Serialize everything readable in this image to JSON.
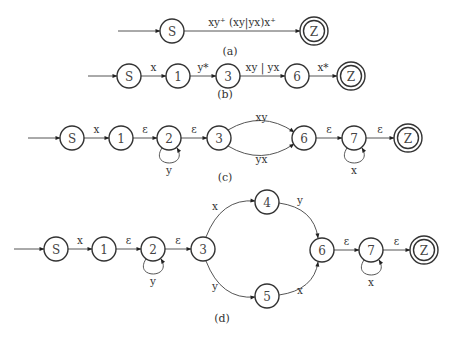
{
  "diagrams": [
    {
      "id": "a",
      "caption": "(a)",
      "caption_pos": [
        230,
        55
      ],
      "start": {
        "from": [
          118,
          31
        ],
        "to": "S"
      },
      "nodes": [
        {
          "id": "S",
          "label": "S",
          "x": 172,
          "y": 31,
          "final": false
        },
        {
          "id": "Z",
          "label": "Z",
          "x": 314,
          "y": 31,
          "final": true
        }
      ],
      "edges": [
        {
          "from": "S",
          "to": "Z",
          "label": "xy⁺ (xy|yx)x⁺",
          "label_text": "xy * (xy|yx)x *",
          "type": "straight"
        }
      ]
    },
    {
      "id": "b",
      "caption": "(b)",
      "caption_pos": [
        225,
        98
      ],
      "start": {
        "from": [
          88,
          76
        ],
        "to": "S"
      },
      "nodes": [
        {
          "id": "S",
          "label": "S",
          "x": 129,
          "y": 76,
          "final": false
        },
        {
          "id": "1",
          "label": "1",
          "x": 178,
          "y": 76,
          "final": false
        },
        {
          "id": "3",
          "label": "3",
          "x": 228,
          "y": 76,
          "final": false
        },
        {
          "id": "6",
          "label": "6",
          "x": 297,
          "y": 76,
          "final": false
        },
        {
          "id": "Z",
          "label": "Z",
          "x": 351,
          "y": 76,
          "final": true
        }
      ],
      "edges": [
        {
          "from": "S",
          "to": "1",
          "label": "x",
          "type": "straight"
        },
        {
          "from": "1",
          "to": "3",
          "label": "y*",
          "type": "straight"
        },
        {
          "from": "3",
          "to": "6",
          "label": "xy | yx",
          "type": "straight"
        },
        {
          "from": "6",
          "to": "Z",
          "label": "x*",
          "type": "straight"
        }
      ]
    },
    {
      "id": "c",
      "caption": "(c)",
      "caption_pos": [
        225,
        181
      ],
      "start": {
        "from": [
          28,
          138
        ],
        "to": "S"
      },
      "nodes": [
        {
          "id": "S",
          "label": "S",
          "x": 72,
          "y": 138,
          "final": false
        },
        {
          "id": "1",
          "label": "1",
          "x": 121,
          "y": 138,
          "final": false
        },
        {
          "id": "2",
          "label": "2",
          "x": 169,
          "y": 138,
          "final": false
        },
        {
          "id": "3",
          "label": "3",
          "x": 219,
          "y": 138,
          "final": false
        },
        {
          "id": "6",
          "label": "6",
          "x": 304,
          "y": 138,
          "final": false
        },
        {
          "id": "7",
          "label": "7",
          "x": 354,
          "y": 138,
          "final": false
        },
        {
          "id": "Z",
          "label": "Z",
          "x": 408,
          "y": 138,
          "final": true
        }
      ],
      "edges": [
        {
          "from": "S",
          "to": "1",
          "label": "x",
          "type": "straight"
        },
        {
          "from": "1",
          "to": "2",
          "label": "ε",
          "type": "straight"
        },
        {
          "from": "2",
          "to": "2",
          "label": "y",
          "type": "loop"
        },
        {
          "from": "2",
          "to": "3",
          "label": "ε",
          "type": "straight"
        },
        {
          "from": "3",
          "to": "6",
          "label": "xy",
          "type": "arc-up"
        },
        {
          "from": "3",
          "to": "6",
          "label": "yx",
          "type": "arc-down"
        },
        {
          "from": "6",
          "to": "7",
          "label": "ε",
          "type": "straight"
        },
        {
          "from": "7",
          "to": "7",
          "label": "x",
          "type": "loop"
        },
        {
          "from": "7",
          "to": "Z",
          "label": "ε",
          "type": "straight"
        }
      ]
    },
    {
      "id": "d",
      "caption": "(d)",
      "caption_pos": [
        222,
        322
      ],
      "start": {
        "from": [
          14,
          249
        ],
        "to": "S"
      },
      "nodes": [
        {
          "id": "S",
          "label": "S",
          "x": 56,
          "y": 249,
          "final": false
        },
        {
          "id": "1",
          "label": "1",
          "x": 104,
          "y": 249,
          "final": false
        },
        {
          "id": "2",
          "label": "2",
          "x": 153,
          "y": 249,
          "final": false
        },
        {
          "id": "3",
          "label": "3",
          "x": 203,
          "y": 249,
          "final": false
        },
        {
          "id": "4",
          "label": "4",
          "x": 267,
          "y": 202,
          "final": false
        },
        {
          "id": "5",
          "label": "5",
          "x": 267,
          "y": 296,
          "final": false
        },
        {
          "id": "6",
          "label": "6",
          "x": 322,
          "y": 250,
          "final": false
        },
        {
          "id": "7",
          "label": "7",
          "x": 371,
          "y": 250,
          "final": false
        },
        {
          "id": "Z",
          "label": "Z",
          "x": 424,
          "y": 250,
          "final": true
        }
      ],
      "edges": [
        {
          "from": "S",
          "to": "1",
          "label": "x",
          "type": "straight"
        },
        {
          "from": "1",
          "to": "2",
          "label": "ε",
          "type": "straight"
        },
        {
          "from": "2",
          "to": "2",
          "label": "y",
          "type": "loop"
        },
        {
          "from": "2",
          "to": "3",
          "label": "ε",
          "type": "straight"
        },
        {
          "from": "3",
          "to": "4",
          "label": "x",
          "type": "curve"
        },
        {
          "from": "4",
          "to": "6",
          "label": "y",
          "type": "curve"
        },
        {
          "from": "3",
          "to": "5",
          "label": "y",
          "type": "curve"
        },
        {
          "from": "5",
          "to": "6",
          "label": "x",
          "type": "curve"
        },
        {
          "from": "6",
          "to": "7",
          "label": "ε",
          "type": "straight"
        },
        {
          "from": "7",
          "to": "7",
          "label": "x",
          "type": "loop"
        },
        {
          "from": "7",
          "to": "Z",
          "label": "ε",
          "type": "straight"
        }
      ]
    }
  ]
}
